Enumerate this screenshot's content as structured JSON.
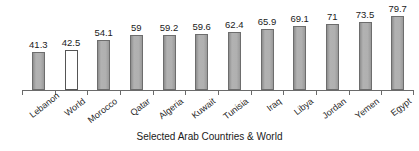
{
  "chart_data": {
    "type": "bar",
    "title": "",
    "xlabel": "Selected Arab Countries & World",
    "ylabel": "",
    "categories": [
      "Lebanon",
      "World",
      "Morocco",
      "Qatar",
      "Algeria",
      "Kuwait",
      "Tunisia",
      "Iraq",
      "Libya",
      "Jordan",
      "Yemen",
      "Egypt"
    ],
    "values": [
      41.3,
      42.5,
      54.1,
      59,
      59.2,
      59.6,
      62.4,
      65.9,
      69.1,
      71,
      73.5,
      79.7
    ],
    "value_labels": [
      "41.3",
      "42.5",
      "54.1",
      "59",
      "59.2",
      "59.6",
      "62.4",
      "65.9",
      "69.1",
      "71",
      "73.5",
      "79.7"
    ],
    "highlight_index": 1,
    "highlight_style": "unfilled-white",
    "bar_fill_color": "#a9a9a9",
    "bar_border_color": "#6d6d6d",
    "highlight_fill_color": "#ffffff",
    "axis_color": "#6a6a6a",
    "text_color": "#1a1a1a",
    "ylim": [
      0,
      88
    ],
    "grid": false,
    "legend": false,
    "label_rotation_deg": -38
  },
  "axis": {
    "x_title": "Selected Arab Countries & World"
  }
}
